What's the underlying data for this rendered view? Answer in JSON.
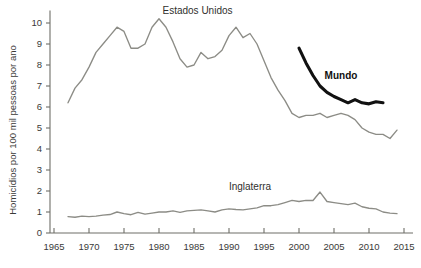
{
  "chart_data": {
    "type": "line",
    "title": "",
    "xlabel": "",
    "ylabel": "Homicídios por 100 mil pessoas por ano",
    "xlim": [
      1965,
      2015
    ],
    "ylim": [
      0,
      10.6
    ],
    "grid": false,
    "legend_position": "inline-annotations",
    "xticks": [
      1965,
      1970,
      1975,
      1980,
      1985,
      1990,
      1995,
      2000,
      2005,
      2010,
      2015
    ],
    "yticks": [
      0,
      1,
      2,
      3,
      4,
      5,
      6,
      7,
      8,
      9,
      10
    ],
    "series": [
      {
        "name": "Estados Unidos",
        "color": "#8c8c86",
        "label_x": 1985.5,
        "label_y": 10.45,
        "x": [
          1967,
          1968,
          1969,
          1970,
          1971,
          1972,
          1973,
          1974,
          1975,
          1976,
          1977,
          1978,
          1979,
          1980,
          1981,
          1982,
          1983,
          1984,
          1985,
          1986,
          1987,
          1988,
          1989,
          1990,
          1991,
          1992,
          1993,
          1994,
          1995,
          1996,
          1997,
          1998,
          1999,
          2000,
          2001,
          2002,
          2003,
          2004,
          2005,
          2006,
          2007,
          2008,
          2009,
          2010,
          2011,
          2012,
          2013,
          2014
        ],
        "values": [
          6.2,
          6.9,
          7.3,
          7.9,
          8.6,
          9.0,
          9.4,
          9.8,
          9.6,
          8.8,
          8.8,
          9.0,
          9.8,
          10.2,
          9.8,
          9.1,
          8.3,
          7.9,
          8.0,
          8.6,
          8.3,
          8.4,
          8.7,
          9.4,
          9.8,
          9.3,
          9.5,
          9.0,
          8.2,
          7.4,
          6.8,
          6.3,
          5.7,
          5.5,
          5.6,
          5.6,
          5.7,
          5.5,
          5.6,
          5.7,
          5.6,
          5.4,
          5.0,
          4.8,
          4.7,
          4.7,
          4.5,
          4.9
        ]
      },
      {
        "name": "Mundo",
        "color": "#111111",
        "label_x": 2006.0,
        "label_y": 7.35,
        "x": [
          2000,
          2001,
          2002,
          2003,
          2004,
          2005,
          2006,
          2007,
          2008,
          2009,
          2010,
          2011,
          2012
        ],
        "values": [
          8.8,
          8.1,
          7.5,
          7.0,
          6.7,
          6.5,
          6.35,
          6.2,
          6.35,
          6.2,
          6.15,
          6.25,
          6.2
        ]
      },
      {
        "name": "Inglaterra",
        "color": "#8c8c86",
        "label_x": 1993.0,
        "label_y": 2.05,
        "x": [
          1967,
          1968,
          1969,
          1970,
          1971,
          1972,
          1973,
          1974,
          1975,
          1976,
          1977,
          1978,
          1979,
          1980,
          1981,
          1982,
          1983,
          1984,
          1985,
          1986,
          1987,
          1988,
          1989,
          1990,
          1991,
          1992,
          1993,
          1994,
          1995,
          1996,
          1997,
          1998,
          1999,
          2000,
          2001,
          2002,
          2003,
          2004,
          2005,
          2006,
          2007,
          2008,
          2009,
          2010,
          2011,
          2012,
          2013,
          2014
        ],
        "values": [
          0.78,
          0.75,
          0.8,
          0.78,
          0.8,
          0.85,
          0.88,
          1.0,
          0.92,
          0.87,
          0.98,
          0.9,
          0.95,
          1.0,
          1.0,
          1.05,
          0.98,
          1.05,
          1.08,
          1.1,
          1.05,
          1.0,
          1.1,
          1.15,
          1.12,
          1.1,
          1.15,
          1.2,
          1.3,
          1.3,
          1.35,
          1.45,
          1.55,
          1.5,
          1.55,
          1.55,
          1.95,
          1.5,
          1.45,
          1.4,
          1.35,
          1.42,
          1.25,
          1.18,
          1.15,
          1.0,
          0.95,
          0.92
        ]
      }
    ]
  }
}
